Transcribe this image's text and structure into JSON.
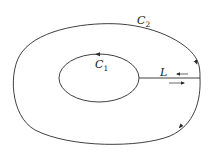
{
  "diagram": {
    "type": "contour-diagram",
    "colors": {
      "stroke": "#2a2a2a",
      "background": "#ffffff"
    },
    "contours": [
      {
        "id": "C2",
        "label": "C",
        "subscript": "2",
        "role": "outer",
        "direction": "clockwise"
      },
      {
        "id": "C1",
        "label": "C",
        "subscript": "1",
        "role": "inner",
        "direction": "counter-clockwise"
      }
    ],
    "cut": {
      "id": "L",
      "label": "L",
      "arrow_upper": "←",
      "arrow_lower": "→"
    }
  }
}
